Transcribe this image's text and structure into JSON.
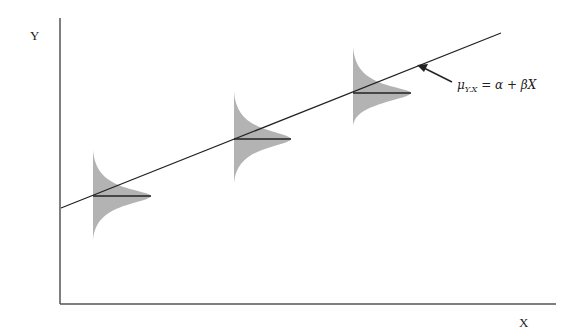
{
  "diagram": {
    "title": "",
    "y_axis_label": "Y",
    "x_axis_label": "X",
    "regression_line": {
      "label_mu": "μ",
      "label_sub": "Y.X",
      "label_rest": " = α + βX",
      "start": [
        61,
        208
      ],
      "end": [
        501,
        33
      ]
    },
    "distributions": [
      {
        "name": "distribution-1",
        "x": 93,
        "top": 150,
        "bottom": 240,
        "mean_y": 196,
        "peak_width": 58
      },
      {
        "name": "distribution-2",
        "x": 234,
        "top": 92,
        "bottom": 183,
        "mean_y": 139,
        "peak_width": 57
      },
      {
        "name": "distribution-3",
        "x": 353,
        "top": 47,
        "bottom": 126,
        "mean_y": 93,
        "peak_width": 58
      }
    ],
    "colors": {
      "fill": "#b3b3b3",
      "line": "#222222",
      "axis": "#555555"
    }
  }
}
